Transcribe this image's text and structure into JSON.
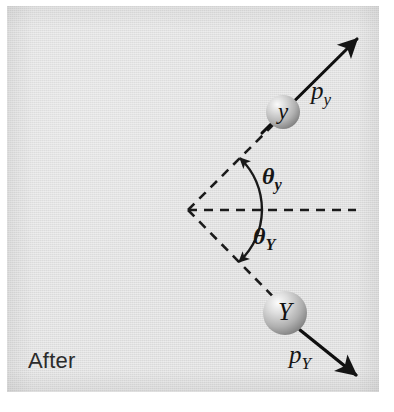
{
  "figure": {
    "stage_label": "After",
    "background_color": "#e2e2e2",
    "ink_color": "#141414",
    "panel": {
      "x": 7,
      "y": 6,
      "width": 372,
      "height": 386
    }
  },
  "particles": [
    {
      "id": "small",
      "symbol": "y",
      "center_x": 283,
      "center_y": 112,
      "radius": 17,
      "fill_light": "#f2f2f2",
      "fill_dark": "#8d8d8d"
    },
    {
      "id": "large",
      "symbol": "Y",
      "center_x": 285,
      "center_y": 313,
      "radius": 22,
      "fill_light": "#f4f4f4",
      "fill_dark": "#8a8a8a"
    }
  ],
  "momentum_vectors": [
    {
      "id": "p-y",
      "label_base": "p",
      "label_sub": "y",
      "from_x": 262,
      "from_y": 133,
      "to_x": 358,
      "to_y": 38,
      "label_x": 311,
      "label_y": 78
    },
    {
      "id": "p-Y",
      "label_base": "p",
      "label_sub": "Y",
      "from_x": 300,
      "from_y": 330,
      "to_x": 358,
      "to_y": 377,
      "label_x": 289,
      "label_y": 342
    }
  ],
  "angles": [
    {
      "id": "theta-y",
      "label_base": "θ",
      "label_sub": "y",
      "value_deg": 45,
      "direction": "above-axis",
      "label_x": 262,
      "label_y": 164
    },
    {
      "id": "theta-Y",
      "label_base": "θ",
      "label_sub": "Y",
      "value_deg": 45,
      "direction": "below-axis",
      "label_x": 253,
      "label_y": 224
    }
  ],
  "geometry": {
    "vertex_x": 188,
    "vertex_y": 210,
    "axis_end_x": 356,
    "axis_end_y": 210,
    "dashed_upper_end_x": 300,
    "dashed_upper_end_y": 98,
    "dashed_lower_end_x": 298,
    "dashed_lower_end_y": 322,
    "dash_pattern": "9 7"
  }
}
